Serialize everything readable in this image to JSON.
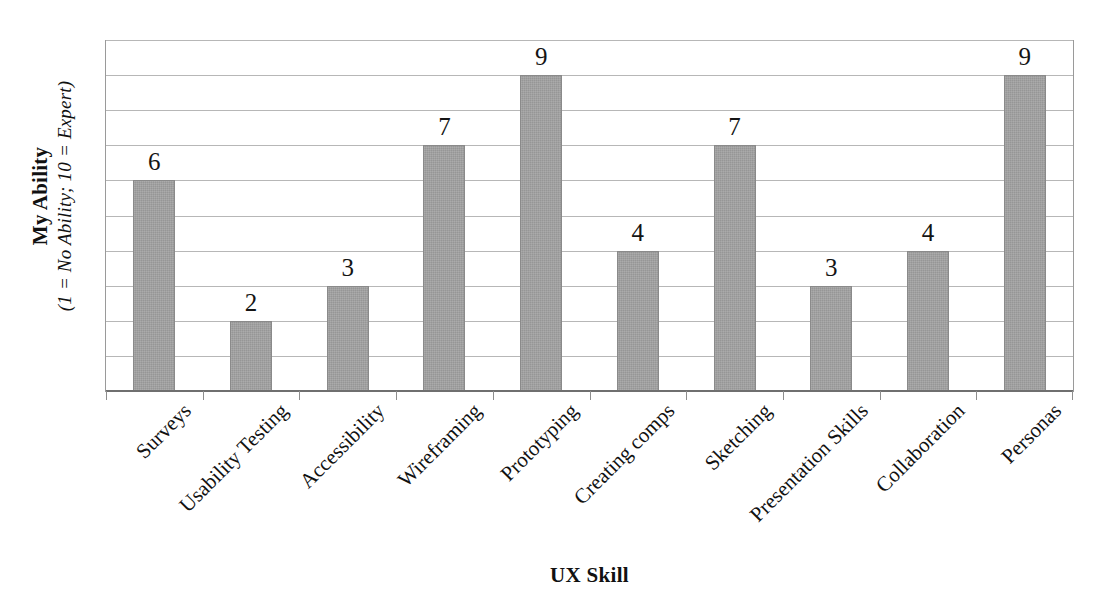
{
  "chart_data": {
    "type": "bar",
    "title": "",
    "categories": [
      "Surveys",
      "Usability Testing",
      "Accessibility",
      "Wireframing",
      "Prototyping",
      "Creating comps",
      "Sketching",
      "Presentation Skills",
      "Collaboration",
      "Personas"
    ],
    "values": [
      6,
      2,
      3,
      7,
      9,
      4,
      7,
      3,
      4,
      9
    ],
    "xlabel": "UX Skill",
    "ylabel": "My Ability",
    "ylabel_sub": "(1 = No Ability; 10 = Expert)",
    "ylim": [
      0,
      10
    ],
    "ytick_values": [
      0,
      1,
      2,
      3,
      4,
      5,
      6,
      7,
      8,
      9,
      10
    ],
    "ytick_labels_shown": false,
    "grid": true,
    "grid_axis": "y",
    "legend": false,
    "data_labels": true,
    "bar_color": "#969696",
    "gridline_color": "#b7b7b7",
    "axis_color": "#6f6f6f",
    "text_color": "#111111",
    "background": "#ffffff"
  },
  "axis": {
    "y_title_main": "My Ability",
    "y_title_sub": "(1 = No Ability; 10 = Expert)",
    "x_title": "UX Skill"
  }
}
